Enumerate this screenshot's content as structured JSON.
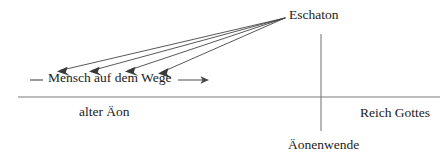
{
  "diagram": {
    "type": "theological-timeline-diagram",
    "language": "de",
    "background_color": "#ffffff",
    "line_color": "#7d7d7d",
    "arrow_color": "#3a3a3a",
    "text_color": "#1b1b1b",
    "labels": {
      "eschaton": "Eschaton",
      "mensch_auf_dem_wege": "Mensch auf dem Wege",
      "alter_aeon": "alter Äon",
      "reich_gottes": "Reich Gottes",
      "aeonenwende": "Äonenwende"
    },
    "axes": {
      "horizontal_baseline": {
        "x1": 18,
        "y1": 97,
        "x2": 440,
        "y2": 97
      },
      "vertical_divider": {
        "x1": 321,
        "y1": 34,
        "x2": 321,
        "y2": 131
      }
    },
    "convergence_point": {
      "x": 285,
      "y": 18
    },
    "eschaton_arrows": [
      {
        "from_x": 285,
        "from_y": 18,
        "to_x": 57,
        "to_y": 71
      },
      {
        "from_x": 285,
        "from_y": 18,
        "to_x": 89,
        "to_y": 71
      },
      {
        "from_x": 285,
        "from_y": 18,
        "to_x": 125,
        "to_y": 71
      },
      {
        "from_x": 285,
        "from_y": 18,
        "to_x": 158,
        "to_y": 73
      }
    ],
    "way_marker": {
      "left_dash": {
        "x1": 30,
        "y1": 80,
        "x2": 43,
        "y2": 80
      },
      "right_arrow": {
        "x1": 178,
        "y1": 80,
        "x2": 208,
        "y2": 80
      }
    }
  }
}
